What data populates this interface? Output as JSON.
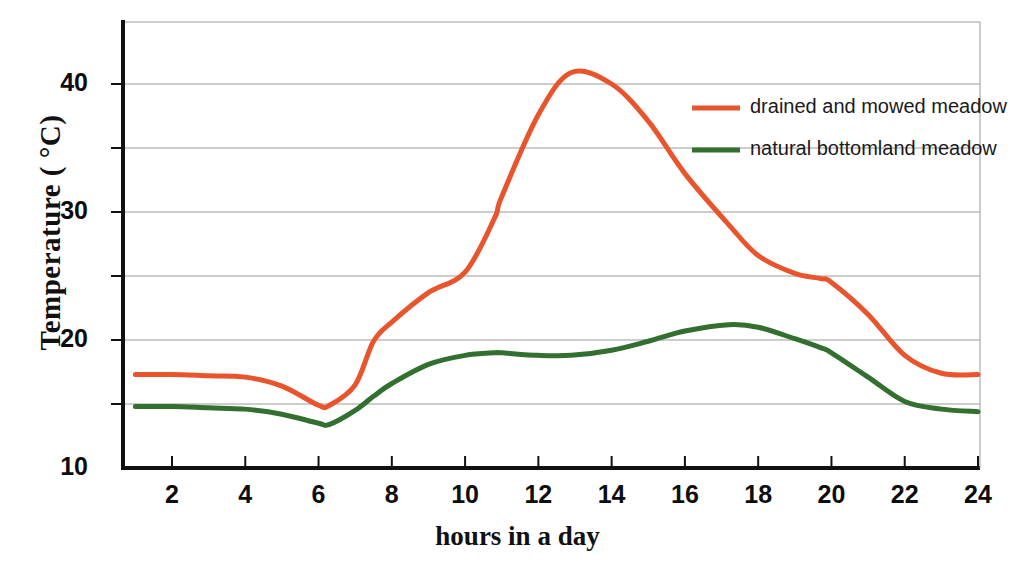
{
  "chart_data": {
    "type": "line",
    "title": "",
    "xlabel": "hours in a day",
    "ylabel": "Temperature  ( °C)",
    "xlim": [
      1,
      24
    ],
    "ylim": [
      10,
      45
    ],
    "xticks": [
      2,
      4,
      6,
      8,
      10,
      12,
      14,
      16,
      18,
      20,
      22,
      24
    ],
    "xtick_labels": [
      "2",
      "4",
      "6",
      "8",
      "10",
      "12",
      "14",
      "16",
      "18",
      "20",
      "22",
      "24"
    ],
    "yticks": [
      10,
      15,
      20,
      25,
      30,
      35,
      40
    ],
    "ytick_labels": [
      "10",
      "",
      "20",
      "",
      "30",
      "",
      "40"
    ],
    "ytick_major_labels": [
      "10",
      "20",
      "30",
      "40"
    ],
    "grid": true,
    "grid_axis": "y",
    "legend_position": "upper right",
    "x": [
      1,
      2,
      3,
      4,
      5,
      6,
      6.3,
      7,
      7.5,
      8,
      9,
      10,
      10.8,
      11,
      12,
      12.9,
      14,
      15,
      16,
      17.2,
      18,
      19,
      19.7,
      20,
      21,
      22,
      23,
      24
    ],
    "series": [
      {
        "name": "drained and mowed meadow",
        "color": "#E8552C",
        "values": [
          17.3,
          17.3,
          17.2,
          17.1,
          16.4,
          14.9,
          14.9,
          16.5,
          19.9,
          21.4,
          23.7,
          25.3,
          29.5,
          31.2,
          37.6,
          40.9,
          40.0,
          37.1,
          33.0,
          29.0,
          26.6,
          25.2,
          24.8,
          24.5,
          22.0,
          18.8,
          17.4,
          17.3
        ]
      },
      {
        "name": "natural bottomland meadow",
        "color": "#33702F",
        "values": [
          14.8,
          14.8,
          14.7,
          14.6,
          14.2,
          13.5,
          13.4,
          14.5,
          15.6,
          16.6,
          18.1,
          18.8,
          19.0,
          19.0,
          18.8,
          18.8,
          19.2,
          19.9,
          20.7,
          21.2,
          21.0,
          20.1,
          19.4,
          19.0,
          17.1,
          15.2,
          14.6,
          14.4
        ]
      }
    ],
    "axis_color": "#111111",
    "grid_color": "#9a9a9a"
  },
  "legend": {
    "entries": [
      {
        "label": "drained and mowed meadow",
        "color": "#E8552C"
      },
      {
        "label": "natural bottomland meadow",
        "color": "#33702F"
      }
    ]
  },
  "axis": {
    "y_title": "Temperature  ( °C)",
    "x_title": "hours in a day"
  }
}
